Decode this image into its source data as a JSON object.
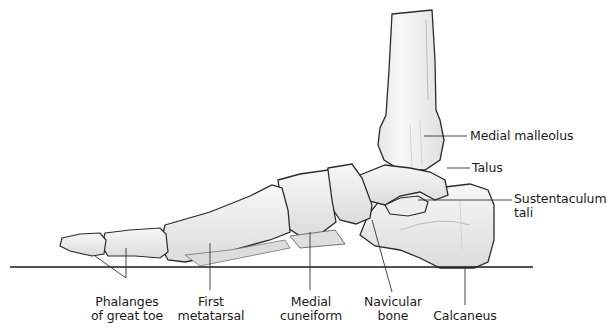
{
  "figure": {
    "colors": {
      "bone_fill": "#f3f3f3",
      "bone_shade": "#d9d9d9",
      "outline": "#2a2a2a",
      "leader": "#333333",
      "ground": "#1a1a1a"
    }
  },
  "labels": {
    "medial_malleolus": {
      "text": "Medial malleolus"
    },
    "talus": {
      "text": "Talus"
    },
    "sustentaculum_tali": {
      "line1": "Sustentaculum",
      "line2": "tali"
    },
    "phalanges": {
      "line1": "Phalanges",
      "line2": "of great toe"
    },
    "first_metatarsal": {
      "line1": "First",
      "line2": "metatarsal"
    },
    "medial_cuneiform": {
      "line1": "Medial",
      "line2": "cuneiform"
    },
    "navicular": {
      "line1": "Navicular",
      "line2": "bone"
    },
    "calcaneus": {
      "text": "Calcaneus"
    }
  }
}
